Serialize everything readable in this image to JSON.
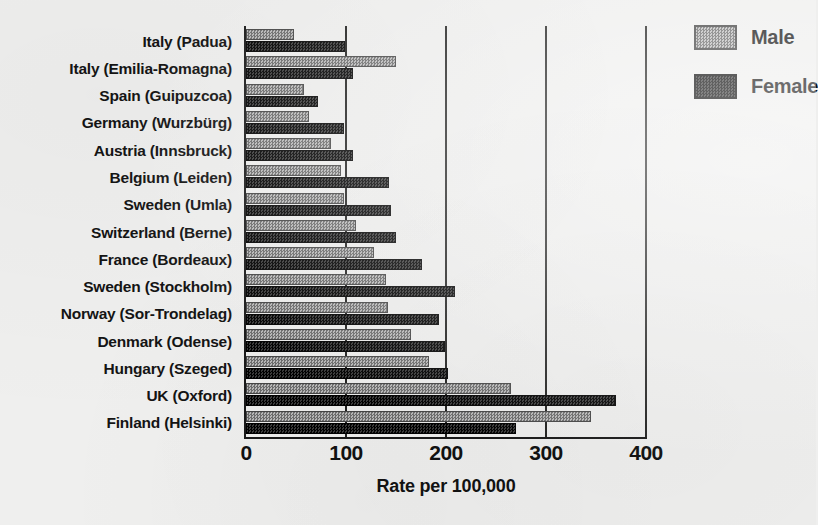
{
  "chart_data": {
    "type": "bar",
    "orientation": "horizontal",
    "title": "",
    "subtitle": "",
    "xlabel": "Rate per 100,000",
    "ylabel": "",
    "xlim": [
      0,
      400
    ],
    "xticks": [
      0,
      100,
      200,
      300,
      400
    ],
    "xtick_labels": [
      "0",
      "100",
      "200",
      "300",
      "400"
    ],
    "grid": true,
    "grid_axis": "x",
    "legend_position": "top-right",
    "categories": [
      "Italy (Padua)",
      "Italy (Emilia-Romagna)",
      "Spain (Guipuzcoa)",
      "Germany (Wurzbürg)",
      "Austria (Innsbruck)",
      "Belgium (Leiden)",
      "Sweden (Umla)",
      "Switzerland (Berne)",
      "France (Bordeaux)",
      "Sweden (Stockholm)",
      "Norway (Sor-Trondelag)",
      "Denmark (Odense)",
      "Hungary (Szeged)",
      "UK (Oxford)",
      "Finland (Helsinki)"
    ],
    "series": [
      {
        "name": "Male",
        "color": "#8e8e8e",
        "values": [
          48,
          150,
          58,
          63,
          85,
          95,
          98,
          110,
          128,
          140,
          142,
          165,
          183,
          265,
          345
        ]
      },
      {
        "name": "Female",
        "color": "#1b1b1b",
        "values": [
          99,
          107,
          72,
          98,
          107,
          143,
          145,
          150,
          176,
          209,
          193,
          199,
          202,
          370,
          270
        ]
      }
    ]
  },
  "legend": {
    "items": [
      {
        "label": "Male",
        "swatch": "male"
      },
      {
        "label": "Female",
        "swatch": "female"
      }
    ]
  }
}
